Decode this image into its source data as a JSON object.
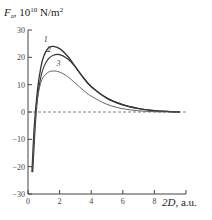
{
  "chart_data": {
    "type": "line",
    "title": "",
    "ylabel_symbol": "F",
    "ylabel_sub": "a",
    "ylabel_units_base": ", 10",
    "ylabel_units_exp": "10",
    "ylabel_units_tail": " N/m",
    "ylabel_units_sq": "2",
    "xlabel_symbol": "2D",
    "xlabel_tail": ", a.u.",
    "xlim": [
      0,
      10
    ],
    "ylim": [
      -30,
      30
    ],
    "xticks": [
      "0",
      "2",
      "4",
      "6",
      "8"
    ],
    "xtick_values": [
      0,
      2,
      4,
      6,
      8
    ],
    "yticks": [
      "30",
      "20",
      "10",
      "0",
      "−10",
      "−20",
      "−30"
    ],
    "ytick_values": [
      30,
      20,
      10,
      0,
      -10,
      -20,
      -30
    ],
    "zero_line": "dashed",
    "grid": false,
    "series": [
      {
        "name": "1",
        "x": [
          0.25,
          0.4,
          0.6,
          0.8,
          1.0,
          1.3,
          1.6,
          2.0,
          2.5,
          3.0,
          3.5,
          4.0,
          5.0,
          6.0,
          7.0,
          8.0,
          9.0,
          9.6
        ],
        "y": [
          -22,
          -5,
          8,
          16,
          20.5,
          23.5,
          24,
          23.2,
          20.5,
          16.5,
          12.5,
          9.2,
          5,
          2.6,
          1.2,
          0.5,
          0.15,
          0
        ]
      },
      {
        "name": "2",
        "x": [
          0.3,
          0.45,
          0.6,
          0.8,
          1.0,
          1.3,
          1.6,
          2.0,
          2.5,
          3.0,
          3.5,
          4.0,
          5.0,
          6.0,
          7.0,
          8.0,
          9.0,
          9.6
        ],
        "y": [
          -22,
          -6,
          5,
          12.5,
          16.5,
          19.5,
          20.8,
          21,
          19.5,
          16.5,
          12.7,
          9.4,
          5.1,
          2.7,
          1.3,
          0.5,
          0.15,
          0
        ]
      },
      {
        "name": "3",
        "x": [
          0.3,
          0.45,
          0.6,
          0.8,
          1.0,
          1.3,
          1.6,
          2.0,
          2.5,
          3.0,
          3.5,
          4.0,
          5.0,
          6.0,
          7.0,
          8.0,
          9.0,
          9.6
        ],
        "y": [
          -20,
          -4,
          5,
          10.5,
          13,
          14.6,
          15,
          14.6,
          13,
          10.5,
          8,
          5.8,
          2.8,
          1.2,
          0.45,
          0.12,
          0.02,
          0
        ]
      }
    ],
    "curve_labels": [
      {
        "text": "1",
        "x": 1.25,
        "y": 25.2
      },
      {
        "text": "2",
        "x": 1.45,
        "y": 21.5
      },
      {
        "text": "3",
        "x": 2.05,
        "y": 16.3
      }
    ],
    "colors": {
      "axis": "#444444",
      "series_1": "#333333",
      "series_2": "#333333",
      "series_3": "#555555",
      "zero_line": "#666666"
    }
  }
}
